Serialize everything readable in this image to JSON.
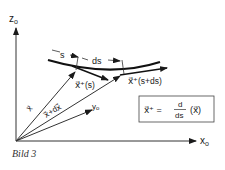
{
  "diagram": {
    "axes": {
      "z_label": "z",
      "z_sub": "o",
      "x_label": "x",
      "x_sub": "o",
      "y_label": "y",
      "y_sub": "o"
    },
    "labels": {
      "s": "s",
      "ds": "ds",
      "tangent_s": "x⃗⁺(s)",
      "tangent_s_ds": "x⃗⁺(s+ds)",
      "vec_x": "x⃗",
      "vec_x_dx": "x⃗+dx⃗"
    },
    "formula": {
      "lhs": "x⃗⁺ =",
      "num": "d",
      "den": "ds",
      "arg": "(x⃗)"
    },
    "caption": "Bild 3"
  }
}
